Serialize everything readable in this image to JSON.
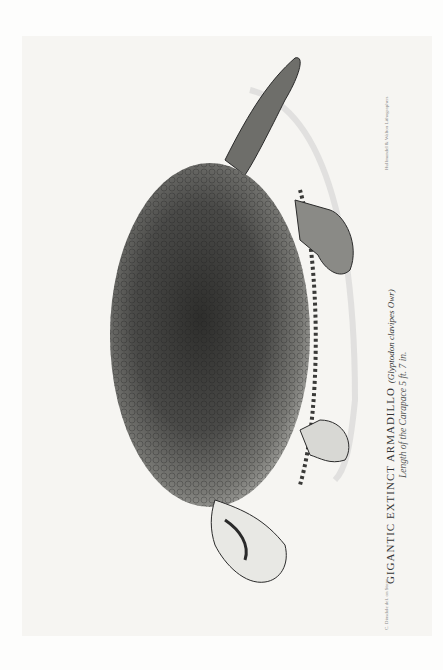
{
  "plate": {
    "title": "GIGANTIC EXTINCT ARMADILLO",
    "scientific_name": "(Glyptodon clavipes Owr)",
    "subtitle": "Length of the Carapace 5 ft. 7 in.",
    "credit_left": "C. Dinsdale del. on Stone",
    "credit_right": "Hullmandel & Walton Lithographers"
  },
  "colors": {
    "background": "#fdfdfc",
    "ink": "#2a2a2a",
    "shell": "#4a4a48"
  }
}
